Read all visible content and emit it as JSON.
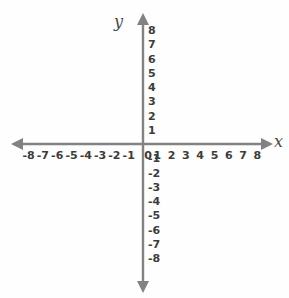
{
  "chart_data": {
    "type": "scatter",
    "title": "",
    "subtitle": "",
    "xlabel": "x",
    "ylabel": "y",
    "xlim": [
      -8,
      8
    ],
    "ylim": [
      -8,
      8
    ],
    "grid": false,
    "legend": null,
    "series": [],
    "x": [],
    "values": [],
    "annotations": [],
    "x_ticks": [
      "-8",
      "-7",
      "-6",
      "-5",
      "-4",
      "-3",
      "-2",
      "-1",
      "0",
      "1",
      "2",
      "3",
      "4",
      "5",
      "6",
      "7",
      "8"
    ],
    "y_ticks": [
      "8",
      "7",
      "6",
      "5",
      "4",
      "3",
      "2",
      "1",
      "-1",
      "-2",
      "-3",
      "-4",
      "-5",
      "-6",
      "-7",
      "-8"
    ]
  },
  "axes": {
    "x_label": "x",
    "y_label": "y",
    "origin_label": "0",
    "line_color": "#828282",
    "text_color": "#3c3c3c",
    "background_color": "#fefefe"
  },
  "x_ticks": [
    {
      "label": "-8",
      "value": -8
    },
    {
      "label": "-7",
      "value": -7
    },
    {
      "label": "-6",
      "value": -6
    },
    {
      "label": "-5",
      "value": -5
    },
    {
      "label": "-4",
      "value": -4
    },
    {
      "label": "-3",
      "value": -3
    },
    {
      "label": "-2",
      "value": -2
    },
    {
      "label": "-1",
      "value": -1
    },
    {
      "label": "0",
      "value": 0
    },
    {
      "label": "1",
      "value": 1
    },
    {
      "label": "2",
      "value": 2
    },
    {
      "label": "3",
      "value": 3
    },
    {
      "label": "4",
      "value": 4
    },
    {
      "label": "5",
      "value": 5
    },
    {
      "label": "6",
      "value": 6
    },
    {
      "label": "7",
      "value": 7
    },
    {
      "label": "8",
      "value": 8
    }
  ],
  "y_ticks": [
    {
      "label": "8",
      "value": 8
    },
    {
      "label": "7",
      "value": 7
    },
    {
      "label": "6",
      "value": 6
    },
    {
      "label": "5",
      "value": 5
    },
    {
      "label": "4",
      "value": 4
    },
    {
      "label": "3",
      "value": 3
    },
    {
      "label": "2",
      "value": 2
    },
    {
      "label": "1",
      "value": 1
    },
    {
      "label": "-1",
      "value": -1
    },
    {
      "label": "-2",
      "value": -2
    },
    {
      "label": "-3",
      "value": -3
    },
    {
      "label": "-4",
      "value": -4
    },
    {
      "label": "-5",
      "value": -5
    },
    {
      "label": "-6",
      "value": -6
    },
    {
      "label": "-7",
      "value": -7
    },
    {
      "label": "-8",
      "value": -8
    }
  ]
}
